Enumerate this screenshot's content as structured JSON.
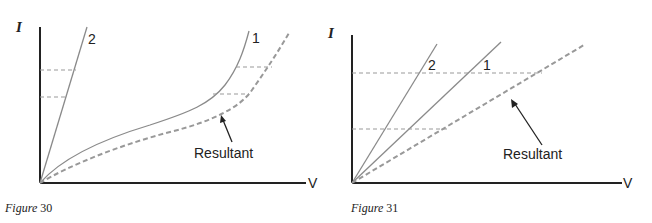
{
  "figures": [
    {
      "id": "figure-30",
      "caption_prefix": "Figure",
      "caption_number": "30",
      "y_axis_label": "I",
      "x_axis_label": "V",
      "curve_labels": [
        "1",
        "2"
      ],
      "resultant_label": "Resultant",
      "description": "Series combination: non-linear curve 1 and linear curve 2; resultant obtained by adding voltages at equal currents"
    },
    {
      "id": "figure-31",
      "caption_prefix": "Figure",
      "caption_number": "31",
      "y_axis_label": "I",
      "x_axis_label": "V",
      "curve_labels": [
        "2",
        "1"
      ],
      "resultant_label": "Resultant",
      "description": "Series combination: two linear characteristics 1 and 2; resultant is a straight line with lower slope"
    }
  ],
  "colors": {
    "line": "#8a8a8a",
    "axis": "#222222",
    "dashed": "#999999",
    "text": "#222222"
  }
}
